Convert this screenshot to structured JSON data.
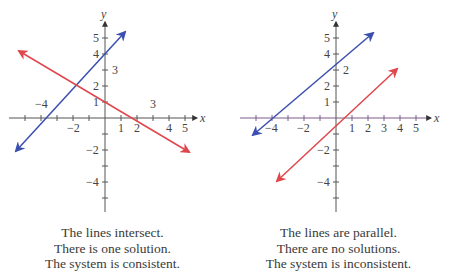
{
  "figures": [
    {
      "id": "left",
      "axes": {
        "x_label": "x",
        "y_label": "y"
      },
      "x_tick_labels": [
        {
          "text": "−4",
          "value": -4,
          "position": "above"
        },
        {
          "text": "−2",
          "value": -2,
          "position": "below"
        },
        {
          "text": "1",
          "value": 1,
          "position": "below"
        },
        {
          "text": "2",
          "value": 2,
          "position": "below"
        },
        {
          "text": "3",
          "value": 3,
          "position": "above"
        },
        {
          "text": "4",
          "value": 4,
          "position": "below"
        },
        {
          "text": "5",
          "value": 5,
          "position": "below"
        }
      ],
      "y_tick_labels": [
        {
          "text": "5",
          "value": 5,
          "side": "left"
        },
        {
          "text": "4",
          "value": 4,
          "side": "left"
        },
        {
          "text": "3",
          "value": 3,
          "side": "right"
        },
        {
          "text": "2",
          "value": 2,
          "side": "left"
        },
        {
          "text": "1",
          "value": 1,
          "side": "left"
        },
        {
          "text": "−2",
          "value": -2,
          "side": "left"
        },
        {
          "text": "−4",
          "value": -4,
          "side": "left"
        }
      ],
      "lines": [
        {
          "name": "blue-line",
          "color": "#3b4fb0",
          "equation": "y = x + 4 (approx)"
        },
        {
          "name": "red-line",
          "color": "#e0474c",
          "equation": "y = -0.6x + 1 (approx)"
        }
      ],
      "caption": [
        "The lines intersect.",
        "There is one solution.",
        "The system is consistent."
      ]
    },
    {
      "id": "right",
      "axes": {
        "x_label": "x",
        "y_label": "y"
      },
      "x_tick_labels": [
        {
          "text": "−4",
          "value": -4
        },
        {
          "text": "−2",
          "value": -2
        },
        {
          "text": "1",
          "value": 1
        },
        {
          "text": "2",
          "value": 2
        },
        {
          "text": "3",
          "value": 3
        },
        {
          "text": "4",
          "value": 4
        },
        {
          "text": "5",
          "value": 5
        }
      ],
      "y_tick_labels": [
        {
          "text": "5",
          "value": 5,
          "side": "left"
        },
        {
          "text": "4",
          "value": 4,
          "side": "left"
        },
        {
          "text": "2",
          "value": 3,
          "side": "right"
        },
        {
          "text": "2",
          "value": 2,
          "side": "left"
        },
        {
          "text": "1",
          "value": 1,
          "side": "left"
        },
        {
          "text": "−2",
          "value": -2,
          "side": "left"
        },
        {
          "text": "−4",
          "value": -4,
          "side": "left"
        }
      ],
      "lines": [
        {
          "name": "blue-line",
          "color": "#3b4fb0"
        },
        {
          "name": "red-line",
          "color": "#e0474c"
        }
      ],
      "caption": [
        "The lines are parallel.",
        "There are no solutions.",
        "The system is inconsistent."
      ]
    }
  ],
  "colors": {
    "blue": "#3b4fb0",
    "red": "#e0474c",
    "axis": "#555555",
    "axis_right_x": "#7a5a8a"
  }
}
